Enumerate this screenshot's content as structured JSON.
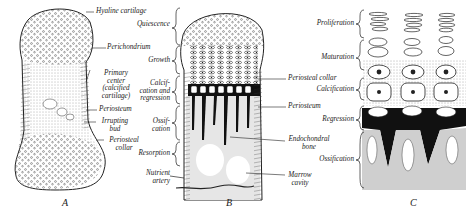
{
  "figure": {
    "panels": [
      {
        "id": "A",
        "letter": "A",
        "labels": {
          "hyaline_cartilage": "Hyaline cartilage",
          "perichondrium": "Perichondrium",
          "primary_center_1": "Primary",
          "primary_center_2": "center",
          "primary_center_3": "(calcified",
          "primary_center_4": "cartilage)",
          "periosteum": "Periosteum",
          "irrupting_bud_1": "Irrupting",
          "irrupting_bud_2": "bud",
          "periosteal_collar_1": "Periosteal",
          "periosteal_collar_2": "collar"
        }
      },
      {
        "id": "B",
        "letter": "B",
        "zone_labels": {
          "quiescence": "Quiescence",
          "growth": "Growth",
          "calcification_1": "Calcif-",
          "calcification_2": "cation and",
          "calcification_3": "regression",
          "ossification_1": "Ossif-",
          "ossification_2": "cation",
          "resorption": "Resorption",
          "nutrient_artery_1": "Nutrient",
          "nutrient_artery_2": "artery"
        },
        "labels": {
          "periosteal_collar": "Periosteal collar",
          "periosteum": "Periosteum",
          "endochondral_bone_1": "Endochondral",
          "endochondral_bone_2": "bone",
          "marrow_cavity_1": "Marrow",
          "marrow_cavity_2": "cavity"
        }
      },
      {
        "id": "C",
        "letter": "C",
        "zone_labels": {
          "proliferation": "Proliferation",
          "maturation": "Maturation",
          "calcification": "Calcification",
          "regression": "Regression",
          "ossification": "Ossification"
        }
      }
    ],
    "colors": {
      "ink": "#222222",
      "bone_gray": "#c8c8c8",
      "background": "#ffffff"
    }
  }
}
